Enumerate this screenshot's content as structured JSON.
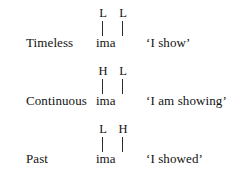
{
  "figure": {
    "background_color": "#ffffff",
    "text_color": "#121212",
    "line_color": "#2a2a2a",
    "rows": [
      {
        "category": "Timeless",
        "tones": [
          "L",
          "L"
        ],
        "segment": "ima",
        "gloss": "‘I show’"
      },
      {
        "category": "Continuous",
        "tones": [
          "H",
          "L"
        ],
        "segment": "ima",
        "gloss": "‘I am showing’"
      },
      {
        "category": "Past",
        "tones": [
          "L",
          "H"
        ],
        "segment": "ima",
        "gloss": "‘I showed’"
      }
    ]
  }
}
